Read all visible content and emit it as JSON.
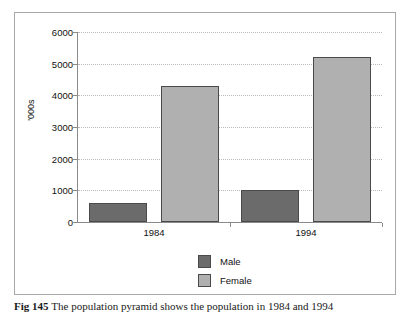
{
  "figure": {
    "caption_label": "Fig 145",
    "caption_text": "The population pyramid shows the population in 1984 and 1994"
  },
  "legend": {
    "position": "bottom-center",
    "items": [
      {
        "label": "Male",
        "color": "#6b6b6b"
      },
      {
        "label": "Female",
        "color": "#b0b0b0"
      }
    ]
  },
  "axis": {
    "y_label": "'000s",
    "y_ticks": [
      "0",
      "1000",
      "2000",
      "3000",
      "4000",
      "5000",
      "6000"
    ],
    "x_categories": [
      "1984",
      "1994"
    ]
  },
  "chart_data": {
    "type": "bar",
    "title": "",
    "subtitle": "",
    "xlabel": "",
    "ylabel": "'000s",
    "categories": [
      "1984",
      "1994"
    ],
    "series": [
      {
        "name": "Male",
        "color": "#6b6b6b",
        "values": [
          600,
          1000
        ]
      },
      {
        "name": "Female",
        "color": "#b0b0b0",
        "values": [
          4300,
          5200
        ]
      }
    ],
    "ylim": [
      0,
      6000
    ],
    "ytick_step": 1000,
    "yticks": [
      0,
      1000,
      2000,
      3000,
      4000,
      5000,
      6000
    ],
    "grid": true,
    "grid_style": "dotted-horizontal",
    "legend": true,
    "legend_position": "bottom-center",
    "annotations": []
  }
}
